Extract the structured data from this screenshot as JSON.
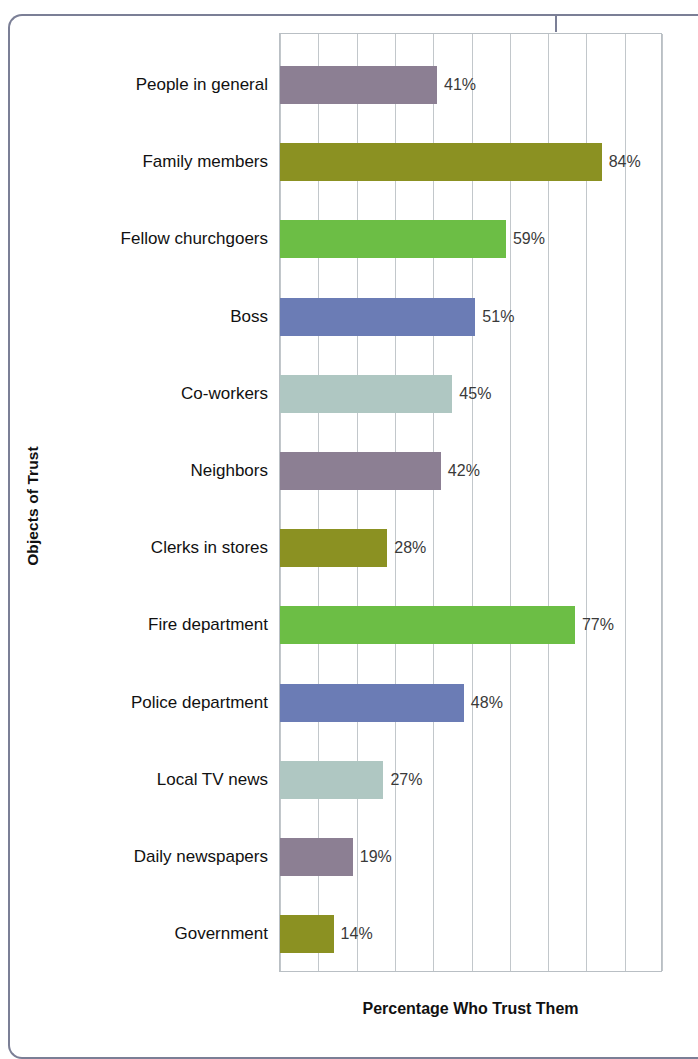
{
  "chart_data": {
    "type": "bar",
    "orientation": "horizontal",
    "title": "",
    "xlabel": "Percentage Who Trust Them",
    "ylabel": "Objects of Trust",
    "xlim": [
      0,
      100
    ],
    "x_tick_labels": [],
    "grid": true,
    "gridline_step": 10,
    "gridline_count": 11,
    "legend": null,
    "value_label_suffix": "%",
    "categories": [
      "People in general",
      "Family members",
      "Fellow churchgoers",
      "Boss",
      "Co-workers",
      "Neighbors",
      "Clerks in stores",
      "Fire department",
      "Police department",
      "Local TV news",
      "Daily newspapers",
      "Government"
    ],
    "values": [
      41,
      84,
      59,
      51,
      45,
      42,
      28,
      77,
      48,
      27,
      19,
      14
    ],
    "value_labels": [
      "41%",
      "84%",
      "59%",
      "51%",
      "45%",
      "42%",
      "28%",
      "77%",
      "48%",
      "27%",
      "19%",
      "14%"
    ],
    "bar_colors": [
      "#8c7f93",
      "#8b9122",
      "#6cbe45",
      "#6b7cb5",
      "#afc7c2",
      "#8c7f93",
      "#8b9122",
      "#6cbe45",
      "#6b7cb5",
      "#afc7c2",
      "#8c7f93",
      "#8b9122"
    ]
  },
  "colors": {
    "mauve": "#8c7f93",
    "olive": "#8b9122",
    "green": "#6cbe45",
    "blue": "#6b7cb5",
    "teal": "#afc7c2",
    "gridline": "#c2c7cb",
    "frame": "#7b7f96",
    "text": "#111111",
    "value_text": "#3a3a3a"
  }
}
